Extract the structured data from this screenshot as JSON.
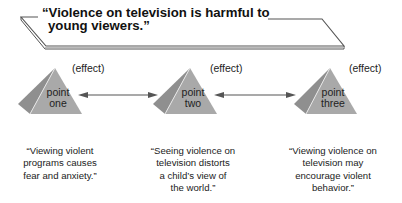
{
  "title": {
    "line1": "“Violence on television is harmful to",
    "line2": "young viewers.”"
  },
  "points": [
    {
      "label_line1": "point",
      "label_line2": "one",
      "effect_label": "(effect)",
      "quote_lines": [
        "“Viewing violent",
        "programs causes",
        "fear and anxiety.”"
      ]
    },
    {
      "label_line1": "point",
      "label_line2": "two",
      "effect_label": "(effect)",
      "quote_lines": [
        "“Seeing violence on",
        "television distorts",
        "a child’s view of",
        "the world.”"
      ]
    },
    {
      "label_line1": "point",
      "label_line2": "three",
      "effect_label": "(effect)",
      "quote_lines": [
        "“Viewing violence on",
        "television may",
        "encourage violent",
        "behavior.”"
      ]
    }
  ],
  "colors": {
    "pyramid_front": "#a9a9a9",
    "pyramid_side": "#8f8f8f",
    "line": "#555555"
  }
}
